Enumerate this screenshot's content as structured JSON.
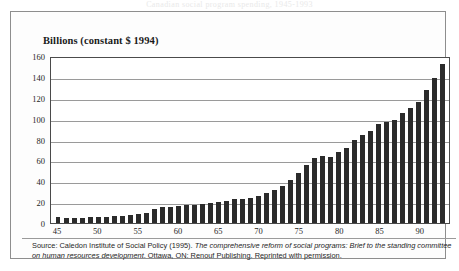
{
  "top_bleed_text": "Canadian social program spending, 1945-1993",
  "frame": {
    "border_color": "#8e8e8e",
    "background": "#fdfdfd"
  },
  "source": {
    "prefix": "Source: Caledon Institute of Social Policy (1995). ",
    "italic_title": "The comprehensive reform of social programs: Brief to the standing committee on human resources development",
    "suffix": ". Ottawa, ON: Renouf Publishing. Reprinted with permission."
  },
  "chart_data": {
    "type": "bar",
    "title": "Billions (constant $ 1994)",
    "xlabel": "",
    "ylabel": "Billions (constant $ 1994)",
    "ylim": [
      0,
      160
    ],
    "yticks": [
      0,
      20,
      40,
      60,
      80,
      100,
      120,
      140,
      160
    ],
    "grid": true,
    "legend": "none",
    "bar_color": "#2b2b2b",
    "xtick_labels": [
      "45",
      "50",
      "55",
      "60",
      "65",
      "70",
      "75",
      "80",
      "85",
      "90"
    ],
    "xtick_years": [
      45,
      50,
      55,
      60,
      65,
      70,
      75,
      80,
      85,
      90
    ],
    "categories": [
      "45",
      "46",
      "47",
      "48",
      "49",
      "50",
      "51",
      "52",
      "53",
      "54",
      "55",
      "56",
      "57",
      "58",
      "59",
      "60",
      "61",
      "62",
      "63",
      "64",
      "65",
      "66",
      "67",
      "68",
      "69",
      "70",
      "71",
      "72",
      "73",
      "74",
      "75",
      "76",
      "77",
      "78",
      "79",
      "80",
      "81",
      "82",
      "83",
      "84",
      "85",
      "86",
      "87",
      "88",
      "89",
      "90",
      "91",
      "92",
      "93"
    ],
    "values": [
      6,
      5,
      5,
      5,
      6,
      6,
      6,
      7,
      7,
      8,
      9,
      10,
      13,
      15,
      15,
      16,
      17,
      17,
      18,
      19,
      20,
      21,
      23,
      23,
      24,
      26,
      29,
      32,
      35,
      41,
      48,
      56,
      62,
      64,
      63,
      68,
      72,
      80,
      84,
      88,
      95,
      97,
      99,
      105,
      110,
      116,
      127,
      139,
      152
    ]
  }
}
